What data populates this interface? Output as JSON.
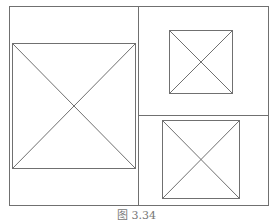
{
  "diagram": {
    "stroke_color": "#707070",
    "frame": {
      "x": 9,
      "y": 6,
      "w": 259,
      "h": 199
    },
    "dividers": {
      "vertical": {
        "x": 138,
        "y1": 6,
        "y2": 205
      },
      "horizontal": {
        "y": 115,
        "x1": 138,
        "x2": 268
      }
    },
    "placeholders": [
      {
        "name": "left",
        "x": 12,
        "y": 43,
        "w": 123,
        "h": 125
      },
      {
        "name": "top-right",
        "x": 169,
        "y": 30,
        "w": 63,
        "h": 63
      },
      {
        "name": "bottom-right",
        "x": 162,
        "y": 120,
        "w": 77,
        "h": 78
      }
    ]
  },
  "caption": "图 3.34"
}
